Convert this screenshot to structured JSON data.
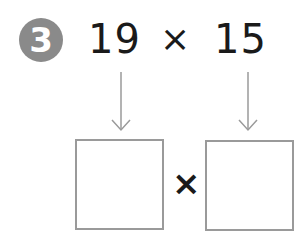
{
  "problem": {
    "number": "3",
    "first_factor": "19",
    "operator": "×",
    "second_factor": "15"
  },
  "answer_row": {
    "operator": "×",
    "left_box_value": "",
    "right_box_value": ""
  },
  "colors": {
    "badge": "#8a8a8a",
    "text": "#1a1a1a",
    "arrow": "#9a9a9a",
    "box_border": "#9a9a9a"
  }
}
